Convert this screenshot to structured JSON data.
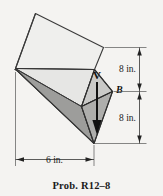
{
  "figure": {
    "caption": "Prob. R12–8",
    "background_color": "#f4f3f1",
    "solid": {
      "name": "rhombic-prism",
      "face_colors": {
        "top": "#efefed",
        "upper_side": "#e3e3e1",
        "lower_side": "#9e9e9c",
        "front_upper": "#cfcfcd",
        "front_lower": "#a8a8a6",
        "edge": "#3c3c3c"
      }
    },
    "labels": {
      "point_b": "B",
      "velocity": "V"
    },
    "dimensions": [
      {
        "id": "upper-height",
        "text": "8 in.",
        "orientation": "vertical"
      },
      {
        "id": "lower-height",
        "text": "8 in.",
        "orientation": "vertical"
      },
      {
        "id": "width",
        "text": "6 in.",
        "orientation": "horizontal"
      }
    ]
  }
}
